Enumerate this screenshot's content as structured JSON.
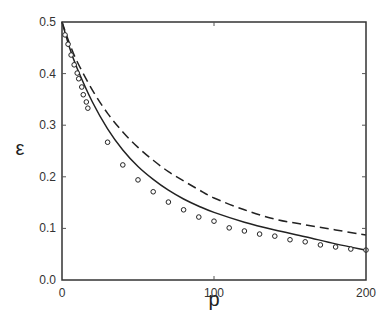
{
  "chart_data": {
    "type": "line",
    "title": "",
    "xlabel": "p",
    "ylabel": "ε",
    "xlim": [
      0,
      200
    ],
    "ylim": [
      0.0,
      0.5
    ],
    "xticks": [
      0,
      100,
      200
    ],
    "xtick_labels": [
      "0",
      "100",
      "200"
    ],
    "yticks": [
      0.0,
      0.1,
      0.2,
      0.3,
      0.4,
      0.5
    ],
    "ytick_labels": [
      "0.0",
      "0.1",
      "0.2",
      "0.3",
      "0.4",
      "0.5"
    ],
    "grid": false,
    "legend": null,
    "series": [
      {
        "name": "data (circles)",
        "style": "markers-open-circle",
        "x": [
          2,
          4,
          6,
          8,
          10,
          11,
          13,
          14,
          16,
          17,
          30,
          40,
          50,
          60,
          70,
          80,
          90,
          100,
          110,
          120,
          130,
          140,
          150,
          160,
          170,
          180,
          190,
          200
        ],
        "y": [
          0.475,
          0.457,
          0.436,
          0.417,
          0.401,
          0.39,
          0.374,
          0.359,
          0.345,
          0.333,
          0.267,
          0.223,
          0.194,
          0.171,
          0.151,
          0.136,
          0.122,
          0.114,
          0.101,
          0.095,
          0.089,
          0.085,
          0.078,
          0.074,
          0.068,
          0.064,
          0.06,
          0.058
        ]
      },
      {
        "name": "solid curve",
        "style": "solid",
        "x": [
          0,
          5,
          10,
          20,
          30,
          40,
          50,
          60,
          70,
          80,
          90,
          100,
          120,
          140,
          160,
          180,
          200
        ],
        "y": [
          0.5,
          0.45,
          0.41,
          0.345,
          0.293,
          0.252,
          0.22,
          0.195,
          0.174,
          0.157,
          0.143,
          0.131,
          0.112,
          0.097,
          0.084,
          0.07,
          0.058
        ]
      },
      {
        "name": "dashed curve",
        "style": "dashed",
        "x": [
          0,
          5,
          10,
          20,
          30,
          40,
          50,
          60,
          70,
          80,
          90,
          100,
          120,
          140,
          160,
          180,
          200
        ],
        "y": [
          0.5,
          0.458,
          0.423,
          0.368,
          0.323,
          0.287,
          0.257,
          0.232,
          0.21,
          0.192,
          0.175,
          0.159,
          0.136,
          0.118,
          0.107,
          0.097,
          0.087
        ]
      }
    ]
  }
}
